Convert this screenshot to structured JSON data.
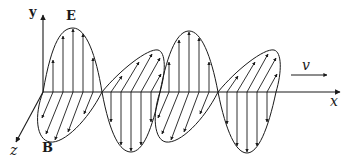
{
  "diagram": {
    "labels": {
      "y_axis": "y",
      "x_axis": "x",
      "z_axis": "z",
      "electric_field": "E",
      "magnetic_field": "B",
      "velocity": "v"
    },
    "colors": {
      "stroke": "#1a1a1a",
      "background": "#ffffff"
    }
  }
}
